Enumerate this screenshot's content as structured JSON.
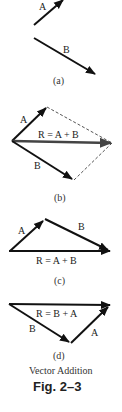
{
  "figure": {
    "title": "Vector Addition",
    "number": "Fig. 2–3",
    "panels": [
      {
        "id": "a",
        "caption": "(a)",
        "labels": {
          "A": "A",
          "B": "B"
        }
      },
      {
        "id": "b",
        "caption": "(b)",
        "labels": {
          "A": "A",
          "B": "B",
          "R": "R = A + B"
        }
      },
      {
        "id": "c",
        "caption": "(c)",
        "labels": {
          "A": "A",
          "B": "B",
          "R": "R = A + B"
        }
      },
      {
        "id": "d",
        "caption": "(d)",
        "labels": {
          "A": "A",
          "B": "B",
          "R": "R = B + A"
        }
      }
    ]
  },
  "colors": {
    "vector": "#111111",
    "resultant": "#444444",
    "dashed": "#555555"
  }
}
